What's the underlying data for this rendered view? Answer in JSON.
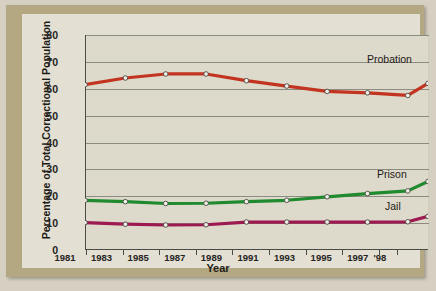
{
  "chart_data": {
    "type": "line",
    "title": "",
    "xlabel": "Year",
    "ylabel": "Percentage of Total Correctional Population",
    "x": [
      1981,
      1983,
      1985,
      1987,
      1989,
      1991,
      1993,
      1995,
      1997,
      1998
    ],
    "categories": [
      "1981",
      "1983",
      "1985",
      "1987",
      "1989",
      "1991",
      "1993",
      "1995",
      "1997",
      "'98"
    ],
    "ylim": [
      0,
      80
    ],
    "yticks": [
      0,
      10,
      20,
      30,
      40,
      50,
      60,
      70,
      80
    ],
    "grid": true,
    "legend_position": "inline-right",
    "series": [
      {
        "name": "Probation",
        "color": "#c2341f",
        "values": [
          61.5,
          64.0,
          65.5,
          65.5,
          63.0,
          61.0,
          59.0,
          58.5,
          57.5,
          62.0
        ]
      },
      {
        "name": "Prison",
        "color": "#1f8a2e",
        "values": [
          18.5,
          18.0,
          17.3,
          17.4,
          18.0,
          18.5,
          19.8,
          21.0,
          22.0,
          25.5
        ]
      },
      {
        "name": "Jail",
        "color": "#9c1a50",
        "values": [
          10.2,
          9.6,
          9.3,
          9.4,
          10.4,
          10.4,
          10.4,
          10.4,
          10.5,
          12.5
        ]
      }
    ]
  },
  "axis": {
    "y_tick_labels": [
      "80",
      "70",
      "60",
      "50",
      "40",
      "30",
      "20",
      "10",
      "0"
    ],
    "x_tick_labels": [
      "1981",
      "1983",
      "1985",
      "1987",
      "1989",
      "1991",
      "1993",
      "1995",
      "1997",
      "'98"
    ],
    "y_title": "Percentage of Total Correctional Population",
    "x_title": "Year"
  },
  "series_labels": {
    "probation": "Probation",
    "prison": "Prison",
    "jail": "Jail"
  },
  "colors": {
    "probation": "#c2341f",
    "prison": "#1f8a2e",
    "jail": "#9c1a50",
    "frame": "#b4a882",
    "paper": "#e3dfd2",
    "plot_bg": "#ddd9cb",
    "axis": "#4a4a46",
    "gridline": "#8d8c83"
  }
}
